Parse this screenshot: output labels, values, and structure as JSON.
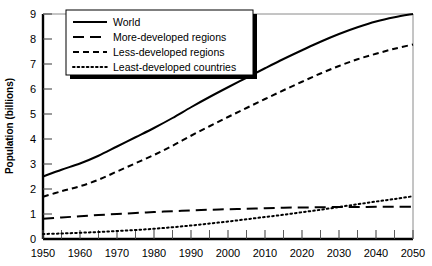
{
  "chart_data": {
    "type": "line",
    "title": "",
    "xlabel": "",
    "ylabel": "Population (billions)",
    "xlim": [
      1950,
      2050
    ],
    "ylim": [
      0,
      9
    ],
    "grid": false,
    "legend_position": "top-left",
    "x_ticks": [
      1950,
      1960,
      1970,
      1980,
      1990,
      2000,
      2010,
      2020,
      2030,
      2040,
      2050
    ],
    "x_minor_step": 5,
    "y_ticks": [
      0,
      1,
      2,
      3,
      4,
      5,
      6,
      7,
      8,
      9
    ],
    "x": [
      1950,
      1955,
      1960,
      1965,
      1970,
      1975,
      1980,
      1985,
      1990,
      1995,
      2000,
      2005,
      2010,
      2015,
      2020,
      2025,
      2030,
      2035,
      2040,
      2045,
      2050
    ],
    "series": [
      {
        "name": "World",
        "style": "solid",
        "values": [
          2.5,
          2.77,
          3.02,
          3.33,
          3.7,
          4.07,
          4.44,
          4.84,
          5.27,
          5.68,
          6.07,
          6.45,
          6.83,
          7.2,
          7.55,
          7.89,
          8.2,
          8.47,
          8.7,
          8.87,
          9.0
        ]
      },
      {
        "name": "More-developed regions",
        "style": "long-dash",
        "values": [
          0.81,
          0.86,
          0.91,
          0.96,
          1.0,
          1.04,
          1.08,
          1.11,
          1.14,
          1.17,
          1.19,
          1.21,
          1.23,
          1.25,
          1.26,
          1.27,
          1.28,
          1.28,
          1.29,
          1.29,
          1.29
        ]
      },
      {
        "name": "Less-developed regions",
        "style": "dash",
        "values": [
          1.69,
          1.91,
          2.11,
          2.37,
          2.7,
          3.03,
          3.36,
          3.73,
          4.13,
          4.51,
          4.88,
          5.24,
          5.6,
          5.95,
          6.29,
          6.62,
          6.92,
          7.19,
          7.41,
          7.61,
          7.78
        ]
      },
      {
        "name": "Least-developed countries",
        "style": "dot",
        "values": [
          0.2,
          0.22,
          0.25,
          0.28,
          0.32,
          0.36,
          0.41,
          0.47,
          0.54,
          0.62,
          0.7,
          0.79,
          0.88,
          0.97,
          1.07,
          1.17,
          1.28,
          1.39,
          1.5,
          1.6,
          1.71
        ]
      }
    ]
  },
  "legend": {
    "items": [
      {
        "label": "World"
      },
      {
        "label": "More-developed regions"
      },
      {
        "label": "Less-developed regions"
      },
      {
        "label": "Least-developed countries"
      }
    ]
  },
  "colors": {
    "line": "#000000",
    "axis": "#000000",
    "background": "#ffffff",
    "legend_shadow": "#000000"
  }
}
